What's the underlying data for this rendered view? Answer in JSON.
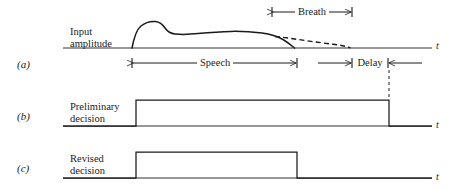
{
  "figure": {
    "panels": [
      {
        "key": "(a)",
        "key_x": 17,
        "key_y": 58,
        "signal_label_lines": [
          "Input",
          "amplitude"
        ],
        "label_x": 70,
        "label_y": 26,
        "axis_var": "t",
        "axis_var_x": 436,
        "axis_var_y": 40,
        "baseline_y": 48,
        "axis_x1": 63,
        "axis_x2": 432
      },
      {
        "key": "(b)",
        "key_x": 17,
        "key_y": 110,
        "signal_label_lines": [
          "Preliminary",
          "decision"
        ],
        "label_x": 70,
        "label_y": 101,
        "axis_var": "t",
        "axis_var_x": 436,
        "axis_var_y": 119,
        "baseline_y": 126,
        "axis_x1": 63,
        "axis_x2": 432,
        "pulse_rise_x": 136,
        "pulse_fall_x": 389,
        "pulse_top_y": 100
      },
      {
        "key": "(c)",
        "key_x": 17,
        "key_y": 162,
        "signal_label_lines": [
          "Revised",
          "decision"
        ],
        "label_x": 70,
        "label_y": 153,
        "axis_var": "t",
        "axis_var_x": 436,
        "axis_var_y": 171,
        "baseline_y": 178,
        "axis_x1": 63,
        "axis_x2": 432,
        "pulse_rise_x": 136,
        "pulse_fall_x": 297,
        "pulse_top_y": 152
      }
    ],
    "spans": [
      {
        "name": "breath",
        "label": "Breath",
        "x1": 272,
        "x2": 352,
        "y": 12,
        "label_cx": 312,
        "label_y": 6,
        "arrow_style": "inside"
      },
      {
        "name": "speech",
        "label": "Speech",
        "x1": 132,
        "x2": 297,
        "y": 63,
        "label_cx": 215,
        "label_y": 57,
        "arrow_style": "inside"
      },
      {
        "name": "delay",
        "label": "Delay",
        "x1": 352,
        "x2": 388,
        "y": 63,
        "label_cx": 370,
        "label_y": 57,
        "arrow_style": "outside",
        "outside_left_x": 318,
        "outside_right_x": 422
      }
    ],
    "waveform": {
      "speech_envelope_path": "M 132 48 C 133.5 40 136 30 141 26 C 146 22 151 21 155.5 21.5 C 160 22 163 25 165 28 C 167.5 31.5 170 33.5 175 34 C 182 34.7 190 34.4 198 33.6 C 209 32.5 220 31.6 231 31.4 C 242 31.2 252 31.8 262 33 C 270 34 277 36 283 39.5 C 288 42.5 291.5 45.5 294.5 48",
      "breath_tail_path": "M 275 36.5 C 285 37.5 295 39 305 40.5 C 315 42 325 43.2 333 44.2 C 340 45.1 345.5 46 350.5 47.8",
      "breath_dash": "5,3.2",
      "connector": {
        "name": "delay-end-connector",
        "x": 389,
        "y1": 70,
        "y2": 100,
        "dash": "3,3"
      }
    },
    "colors": {
      "ink": "#1a1a1a",
      "background": "#ffffff"
    }
  }
}
